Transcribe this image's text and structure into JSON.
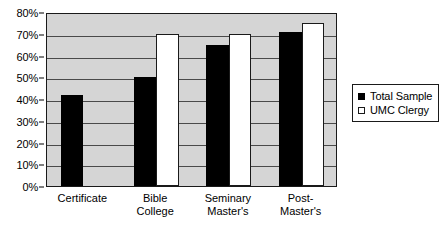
{
  "chart_data": {
    "type": "bar",
    "title": "",
    "subtitle": "",
    "xlabel": "",
    "ylabel": "",
    "categories": [
      "Certificate",
      "Bible College",
      "Seminary Master's",
      "Post-Master's"
    ],
    "category_lines": [
      [
        "Certificate"
      ],
      [
        "Bible",
        "College"
      ],
      [
        "Seminary",
        "Master's"
      ],
      [
        "Post-",
        "Master's"
      ]
    ],
    "series": [
      {
        "name": "Total Sample",
        "color": "#000000",
        "style": "filled",
        "values": [
          42,
          50,
          65,
          71
        ]
      },
      {
        "name": "UMC Clergy",
        "color": "#ffffff",
        "style": "hollow",
        "values": [
          0,
          70,
          70,
          75
        ]
      }
    ],
    "ylim": [
      0,
      80
    ],
    "ytick_values": [
      0,
      10,
      20,
      30,
      40,
      50,
      60,
      70,
      80
    ],
    "ytick_labels": [
      "0%",
      "10%",
      "20%",
      "30%",
      "40%",
      "50%",
      "60%",
      "70%",
      "80%"
    ],
    "grid": true,
    "grid_axis": "y",
    "legend_position": "right",
    "plot_background": "#d5d5d5",
    "axis_color": "#1a1a1a",
    "gridline_color": "#4a4a4a"
  }
}
